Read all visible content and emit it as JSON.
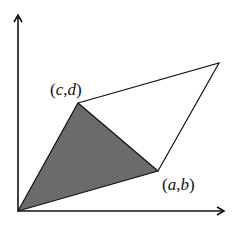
{
  "diagram": {
    "type": "parallelogram-area",
    "colors": {
      "stroke": "#111111",
      "fill_triangle": "#6b6b6b",
      "background": "#ffffff"
    },
    "axes": {
      "origin": [
        18,
        211
      ],
      "x_arrow_tip": [
        224,
        211
      ],
      "y_arrow_tip": [
        18,
        15
      ]
    },
    "vertices": {
      "origin": [
        18,
        211
      ],
      "a_b": [
        158,
        171
      ],
      "c_d": [
        78,
        103
      ],
      "sum": [
        219,
        63
      ]
    },
    "labels": {
      "c_d": {
        "text": "(c,d)",
        "open": "(",
        "var1": "c",
        "sep": ",",
        "var2": "d",
        "close": ")"
      },
      "a_b": {
        "text": "(a,b)",
        "open": "(",
        "var1": "a",
        "sep": ",",
        "var2": "b",
        "close": ")"
      }
    },
    "shaded_region": "triangle origin-(a,b)-(c,d)"
  }
}
